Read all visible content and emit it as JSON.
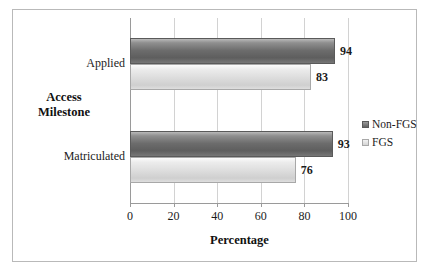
{
  "chart_data": {
    "type": "bar",
    "orientation": "horizontal",
    "title": "",
    "xlabel": "Percentage",
    "ylabel": "Access Milestone",
    "categories": [
      "Applied",
      "Matriculated"
    ],
    "series": [
      {
        "name": "Non-FGS",
        "values": [
          94,
          93
        ],
        "color": "#6c6c6c"
      },
      {
        "name": "FGS",
        "values": [
          83,
          76
        ],
        "color": "#dcdcdc"
      }
    ],
    "xlim": [
      0,
      100
    ],
    "xticks": [
      0,
      20,
      40,
      60,
      80,
      100
    ],
    "xtick_labels": [
      "0",
      "20",
      "40",
      "60",
      "80",
      "100"
    ],
    "grid": true,
    "grid_axis": "x",
    "legend_position": "right",
    "data_labels": [
      "94",
      "83",
      "93",
      "76"
    ]
  },
  "axes": {
    "y_title_line1": "Access",
    "y_title_line2": "Milestone"
  },
  "colors": {
    "border": "#b9b9b9",
    "gridline": "#d2d2d2",
    "axis": "#9a9a9a",
    "text": "#1b1b1b"
  }
}
